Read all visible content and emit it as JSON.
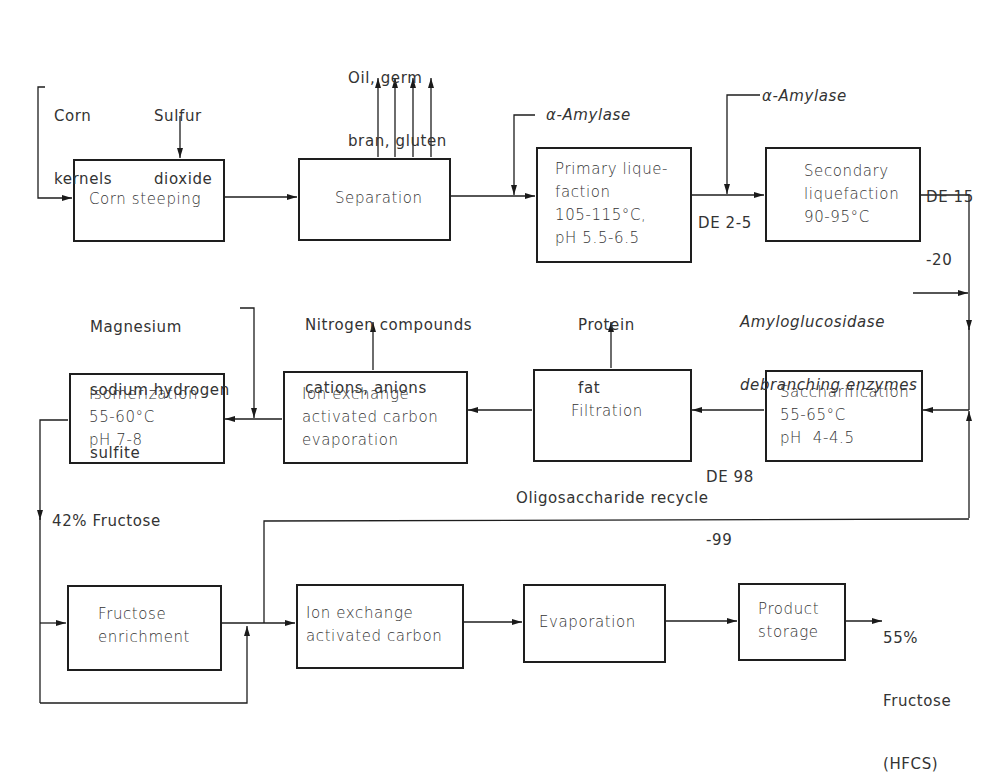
{
  "diagram": {
    "type": "process-flow",
    "nodes": {
      "corn_steeping": {
        "lines": [
          "Corn steeping"
        ]
      },
      "separation": {
        "lines": [
          "Separation"
        ]
      },
      "primary_liquefaction": {
        "lines": [
          "Primary lique-",
          "faction",
          "105-115°C,",
          "pH 5.5-6.5"
        ]
      },
      "secondary_liquefaction": {
        "lines": [
          "Secondary",
          "liquefaction",
          "90-95°C"
        ]
      },
      "saccharification": {
        "lines": [
          "Saccharification",
          "55-65°C",
          "pH  4-4.5"
        ]
      },
      "filtration": {
        "lines": [
          "Filtration"
        ]
      },
      "ion_exchange_1": {
        "lines": [
          "Ion exchange",
          "activated carbon",
          "evaporation"
        ]
      },
      "isomerization": {
        "lines": [
          "Isomerization",
          "55-60°C",
          "pH 7-8"
        ]
      },
      "fructose_enrichment": {
        "lines": [
          "Fructose",
          "enrichment"
        ]
      },
      "ion_exchange_2": {
        "lines": [
          "Ion exchange",
          "activated carbon"
        ]
      },
      "evaporation": {
        "lines": [
          "Evaporation"
        ]
      },
      "product_storage": {
        "lines": [
          "Product",
          "storage"
        ]
      }
    },
    "labels": {
      "corn_kernels": [
        "Corn",
        "kernels"
      ],
      "sulfur_dioxide": [
        "Sulfur",
        "dioxide"
      ],
      "separation_outputs": [
        "Oil, germ",
        "bran, gluten"
      ],
      "alpha_amylase_1": "α-Amylase",
      "alpha_amylase_2": "α-Amylase",
      "de_2_5": "DE 2-5",
      "de_15_20": [
        "DE 15",
        "-20"
      ],
      "amyloglucosidase": [
        "Amyloglucosidase",
        "debranching enzymes"
      ],
      "protein_fat": [
        "Protein",
        "fat"
      ],
      "nitrogen_compounds": [
        "Nitrogen compounds",
        "cations, anions"
      ],
      "magnesium_sulfite": [
        "Magnesium",
        "sodium hydrogen",
        "sulfite"
      ],
      "de_98_99": [
        "DE 98",
        "-99"
      ],
      "fructose_42": "42% Fructose",
      "oligosaccharide_recycle": "Oligosaccharide recycle",
      "hfcs_output": [
        "55%",
        "Fructose",
        "(HFCS)"
      ]
    },
    "edges": [
      [
        "corn_kernels",
        "corn_steeping"
      ],
      [
        "sulfur_dioxide",
        "corn_steeping"
      ],
      [
        "corn_steeping",
        "separation"
      ],
      [
        "separation",
        "separation_outputs"
      ],
      [
        "separation",
        "primary_liquefaction"
      ],
      [
        "alpha_amylase_1",
        "primary_liquefaction"
      ],
      [
        "primary_liquefaction",
        "secondary_liquefaction"
      ],
      [
        "alpha_amylase_2",
        "secondary_liquefaction"
      ],
      [
        "secondary_liquefaction",
        "saccharification"
      ],
      [
        "amyloglucosidase",
        "saccharification"
      ],
      [
        "saccharification",
        "filtration"
      ],
      [
        "filtration",
        "protein_fat"
      ],
      [
        "filtration",
        "ion_exchange_1"
      ],
      [
        "ion_exchange_1",
        "nitrogen_compounds"
      ],
      [
        "ion_exchange_1",
        "isomerization"
      ],
      [
        "magnesium_sulfite",
        "isomerization"
      ],
      [
        "isomerization",
        "fructose_enrichment"
      ],
      [
        "isomerization",
        "ion_exchange_2"
      ],
      [
        "fructose_enrichment",
        "ion_exchange_2"
      ],
      [
        "fructose_enrichment",
        "saccharification"
      ],
      [
        "ion_exchange_2",
        "evaporation"
      ],
      [
        "evaporation",
        "product_storage"
      ],
      [
        "product_storage",
        "hfcs_output"
      ]
    ]
  }
}
